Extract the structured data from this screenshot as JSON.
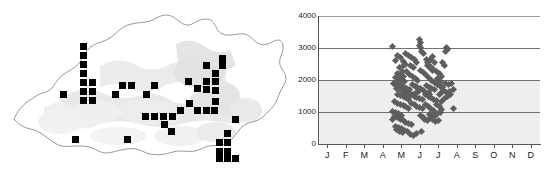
{
  "figure": {
    "panels": [
      "distribution-map",
      "altitude-month-scatter"
    ]
  },
  "map": {
    "region_name": "Bhutan",
    "outline_color": "#8c8c8c",
    "terrain_color": "#e2e2e2",
    "marker_color": "#000000",
    "marker_shape": "square",
    "marker_count": 62,
    "markers": [
      {
        "x": 80,
        "y": 43
      },
      {
        "x": 80,
        "y": 52
      },
      {
        "x": 80,
        "y": 61
      },
      {
        "x": 80,
        "y": 70
      },
      {
        "x": 80,
        "y": 79
      },
      {
        "x": 80,
        "y": 88
      },
      {
        "x": 89,
        "y": 79
      },
      {
        "x": 89,
        "y": 88
      },
      {
        "x": 80,
        "y": 97
      },
      {
        "x": 89,
        "y": 97
      },
      {
        "x": 60,
        "y": 91
      },
      {
        "x": 112,
        "y": 91
      },
      {
        "x": 119,
        "y": 82
      },
      {
        "x": 128,
        "y": 82
      },
      {
        "x": 143,
        "y": 91
      },
      {
        "x": 151,
        "y": 82
      },
      {
        "x": 185,
        "y": 78
      },
      {
        "x": 194,
        "y": 85
      },
      {
        "x": 203,
        "y": 78
      },
      {
        "x": 203,
        "y": 86
      },
      {
        "x": 212,
        "y": 78
      },
      {
        "x": 212,
        "y": 87
      },
      {
        "x": 203,
        "y": 62
      },
      {
        "x": 219,
        "y": 62
      },
      {
        "x": 219,
        "y": 55
      },
      {
        "x": 212,
        "y": 70
      },
      {
        "x": 186,
        "y": 100
      },
      {
        "x": 194,
        "y": 107
      },
      {
        "x": 203,
        "y": 107
      },
      {
        "x": 211,
        "y": 107
      },
      {
        "x": 212,
        "y": 98
      },
      {
        "x": 177,
        "y": 107
      },
      {
        "x": 142,
        "y": 113
      },
      {
        "x": 151,
        "y": 113
      },
      {
        "x": 160,
        "y": 113
      },
      {
        "x": 169,
        "y": 113
      },
      {
        "x": 161,
        "y": 121
      },
      {
        "x": 168,
        "y": 128
      },
      {
        "x": 232,
        "y": 116
      },
      {
        "x": 224,
        "y": 130
      },
      {
        "x": 216,
        "y": 139
      },
      {
        "x": 224,
        "y": 139
      },
      {
        "x": 216,
        "y": 148
      },
      {
        "x": 224,
        "y": 148
      },
      {
        "x": 216,
        "y": 155
      },
      {
        "x": 224,
        "y": 155
      },
      {
        "x": 232,
        "y": 155
      },
      {
        "x": 72,
        "y": 136
      },
      {
        "x": 124,
        "y": 136
      }
    ]
  },
  "chart_data": {
    "type": "scatter",
    "title": "",
    "xlabel": "",
    "ylabel": "",
    "xlim": [
      0,
      12
    ],
    "ylim": [
      0,
      4000
    ],
    "grid": true,
    "legend": false,
    "y_ticks": [
      0,
      1000,
      2000,
      3000,
      4000
    ],
    "y_tick_labels": [
      "0",
      "1000",
      "2000",
      "3000",
      "4000"
    ],
    "x_ticks": [
      1,
      2,
      3,
      4,
      5,
      6,
      7,
      8,
      9,
      10,
      11,
      12
    ],
    "x_tick_labels": [
      "J",
      "F",
      "M",
      "A",
      "M",
      "J",
      "J",
      "A",
      "S",
      "O",
      "N",
      "D"
    ],
    "marker_shape": "diamond",
    "marker_color": "#5e5e5e",
    "point_count": 178,
    "points": [
      {
        "x": 4.05,
        "y": 3060
      },
      {
        "x": 4.3,
        "y": 2760
      },
      {
        "x": 4.45,
        "y": 2700
      },
      {
        "x": 4.2,
        "y": 2620
      },
      {
        "x": 4.6,
        "y": 2580
      },
      {
        "x": 4.75,
        "y": 2820
      },
      {
        "x": 4.9,
        "y": 2760
      },
      {
        "x": 5.05,
        "y": 2690
      },
      {
        "x": 5.2,
        "y": 2640
      },
      {
        "x": 5.35,
        "y": 2560
      },
      {
        "x": 5.5,
        "y": 3260
      },
      {
        "x": 5.55,
        "y": 3180
      },
      {
        "x": 5.5,
        "y": 3090
      },
      {
        "x": 5.52,
        "y": 3010
      },
      {
        "x": 5.6,
        "y": 2900
      },
      {
        "x": 5.7,
        "y": 2820
      },
      {
        "x": 5.85,
        "y": 2640
      },
      {
        "x": 5.9,
        "y": 2560
      },
      {
        "x": 6.1,
        "y": 2640
      },
      {
        "x": 6.2,
        "y": 2740
      },
      {
        "x": 6.3,
        "y": 2560
      },
      {
        "x": 6.95,
        "y": 3020
      },
      {
        "x": 7.0,
        "y": 2940
      },
      {
        "x": 6.9,
        "y": 2900
      },
      {
        "x": 4.4,
        "y": 2380
      },
      {
        "x": 4.55,
        "y": 2280
      },
      {
        "x": 4.3,
        "y": 2200
      },
      {
        "x": 4.45,
        "y": 2140
      },
      {
        "x": 4.6,
        "y": 2100
      },
      {
        "x": 4.2,
        "y": 2080
      },
      {
        "x": 4.35,
        "y": 2020
      },
      {
        "x": 4.5,
        "y": 1980
      },
      {
        "x": 4.65,
        "y": 1940
      },
      {
        "x": 4.8,
        "y": 2260
      },
      {
        "x": 4.95,
        "y": 2180
      },
      {
        "x": 5.1,
        "y": 2100
      },
      {
        "x": 5.25,
        "y": 2040
      },
      {
        "x": 5.4,
        "y": 1980
      },
      {
        "x": 5.55,
        "y": 2300
      },
      {
        "x": 5.7,
        "y": 2220
      },
      {
        "x": 5.85,
        "y": 2140
      },
      {
        "x": 6.0,
        "y": 2060
      },
      {
        "x": 6.15,
        "y": 1980
      },
      {
        "x": 6.3,
        "y": 1920
      },
      {
        "x": 6.45,
        "y": 2040
      },
      {
        "x": 6.6,
        "y": 1960
      },
      {
        "x": 6.1,
        "y": 2420
      },
      {
        "x": 6.25,
        "y": 2340
      },
      {
        "x": 6.4,
        "y": 2280
      },
      {
        "x": 6.55,
        "y": 2200
      },
      {
        "x": 6.7,
        "y": 2120
      },
      {
        "x": 4.1,
        "y": 1880
      },
      {
        "x": 4.25,
        "y": 1820
      },
      {
        "x": 4.4,
        "y": 1780
      },
      {
        "x": 4.55,
        "y": 1740
      },
      {
        "x": 4.7,
        "y": 1700
      },
      {
        "x": 4.85,
        "y": 1660
      },
      {
        "x": 4.2,
        "y": 1900
      },
      {
        "x": 4.35,
        "y": 1860
      },
      {
        "x": 4.5,
        "y": 1820
      },
      {
        "x": 4.65,
        "y": 1780
      },
      {
        "x": 4.8,
        "y": 1740
      },
      {
        "x": 4.95,
        "y": 1700
      },
      {
        "x": 5.1,
        "y": 1860
      },
      {
        "x": 5.25,
        "y": 1800
      },
      {
        "x": 5.4,
        "y": 1760
      },
      {
        "x": 5.55,
        "y": 1720
      },
      {
        "x": 5.7,
        "y": 1680
      },
      {
        "x": 5.85,
        "y": 1820
      },
      {
        "x": 6.0,
        "y": 1780
      },
      {
        "x": 6.15,
        "y": 1740
      },
      {
        "x": 6.3,
        "y": 1700
      },
      {
        "x": 6.45,
        "y": 1860
      },
      {
        "x": 6.6,
        "y": 1800
      },
      {
        "x": 6.75,
        "y": 1760
      },
      {
        "x": 6.9,
        "y": 1900
      },
      {
        "x": 7.05,
        "y": 1860
      },
      {
        "x": 7.2,
        "y": 1880
      },
      {
        "x": 6.8,
        "y": 1660
      },
      {
        "x": 6.95,
        "y": 1620
      },
      {
        "x": 4.3,
        "y": 1560
      },
      {
        "x": 4.45,
        "y": 1520
      },
      {
        "x": 4.6,
        "y": 1480
      },
      {
        "x": 4.75,
        "y": 1440
      },
      {
        "x": 4.9,
        "y": 1400
      },
      {
        "x": 5.05,
        "y": 1560
      },
      {
        "x": 5.2,
        "y": 1500
      },
      {
        "x": 5.35,
        "y": 1460
      },
      {
        "x": 5.5,
        "y": 1420
      },
      {
        "x": 5.65,
        "y": 1380
      },
      {
        "x": 5.8,
        "y": 1540
      },
      {
        "x": 5.95,
        "y": 1480
      },
      {
        "x": 6.1,
        "y": 1440
      },
      {
        "x": 6.25,
        "y": 1400
      },
      {
        "x": 6.4,
        "y": 1360
      },
      {
        "x": 4.15,
        "y": 1320
      },
      {
        "x": 4.3,
        "y": 1280
      },
      {
        "x": 4.45,
        "y": 1240
      },
      {
        "x": 4.6,
        "y": 1200
      },
      {
        "x": 4.75,
        "y": 1160
      },
      {
        "x": 4.9,
        "y": 1120
      },
      {
        "x": 5.05,
        "y": 1260
      },
      {
        "x": 5.2,
        "y": 1220
      },
      {
        "x": 5.35,
        "y": 1180
      },
      {
        "x": 5.5,
        "y": 1140
      },
      {
        "x": 5.65,
        "y": 1100
      },
      {
        "x": 5.8,
        "y": 1240
      },
      {
        "x": 5.95,
        "y": 1180
      },
      {
        "x": 6.1,
        "y": 1120
      },
      {
        "x": 6.25,
        "y": 1060
      },
      {
        "x": 6.4,
        "y": 1220
      },
      {
        "x": 6.55,
        "y": 1160
      },
      {
        "x": 6.7,
        "y": 1080
      },
      {
        "x": 7.3,
        "y": 1100
      },
      {
        "x": 4.05,
        "y": 1020
      },
      {
        "x": 4.2,
        "y": 980
      },
      {
        "x": 4.35,
        "y": 940
      },
      {
        "x": 4.5,
        "y": 900
      },
      {
        "x": 4.15,
        "y": 860
      },
      {
        "x": 4.3,
        "y": 820
      },
      {
        "x": 4.0,
        "y": 780
      },
      {
        "x": 4.45,
        "y": 760
      },
      {
        "x": 4.6,
        "y": 720
      },
      {
        "x": 4.75,
        "y": 680
      },
      {
        "x": 4.9,
        "y": 640
      },
      {
        "x": 5.05,
        "y": 600
      },
      {
        "x": 4.2,
        "y": 560
      },
      {
        "x": 4.35,
        "y": 520
      },
      {
        "x": 4.5,
        "y": 480
      },
      {
        "x": 4.25,
        "y": 440
      },
      {
        "x": 4.4,
        "y": 400
      },
      {
        "x": 4.55,
        "y": 360
      },
      {
        "x": 4.7,
        "y": 420
      },
      {
        "x": 4.85,
        "y": 380
      },
      {
        "x": 5.0,
        "y": 300
      },
      {
        "x": 5.15,
        "y": 260
      },
      {
        "x": 5.3,
        "y": 340
      },
      {
        "x": 5.6,
        "y": 400
      },
      {
        "x": 5.75,
        "y": 760
      },
      {
        "x": 5.9,
        "y": 720
      },
      {
        "x": 6.05,
        "y": 800
      },
      {
        "x": 6.2,
        "y": 760
      },
      {
        "x": 6.35,
        "y": 700
      },
      {
        "x": 6.5,
        "y": 740
      },
      {
        "x": 6.05,
        "y": 920
      },
      {
        "x": 6.2,
        "y": 880
      },
      {
        "x": 5.55,
        "y": 880
      },
      {
        "x": 5.7,
        "y": 840
      },
      {
        "x": 6.6,
        "y": 1000
      },
      {
        "x": 6.45,
        "y": 960
      },
      {
        "x": 6.35,
        "y": 900
      },
      {
        "x": 6.7,
        "y": 1340
      },
      {
        "x": 6.85,
        "y": 1420
      },
      {
        "x": 7.0,
        "y": 1480
      },
      {
        "x": 7.15,
        "y": 1560
      },
      {
        "x": 7.3,
        "y": 1700
      },
      {
        "x": 6.55,
        "y": 1560
      },
      {
        "x": 6.7,
        "y": 1620
      },
      {
        "x": 5.95,
        "y": 1620
      },
      {
        "x": 6.05,
        "y": 1560
      },
      {
        "x": 5.45,
        "y": 1640
      },
      {
        "x": 5.3,
        "y": 1600
      },
      {
        "x": 5.15,
        "y": 1560
      },
      {
        "x": 5.0,
        "y": 1520
      },
      {
        "x": 4.85,
        "y": 1580
      },
      {
        "x": 4.7,
        "y": 1620
      },
      {
        "x": 4.55,
        "y": 1660
      },
      {
        "x": 4.4,
        "y": 1700
      },
      {
        "x": 4.25,
        "y": 1740
      },
      {
        "x": 4.6,
        "y": 2440
      },
      {
        "x": 4.75,
        "y": 2480
      },
      {
        "x": 5.9,
        "y": 2460
      },
      {
        "x": 6.05,
        "y": 2380
      },
      {
        "x": 6.2,
        "y": 2300
      },
      {
        "x": 5.15,
        "y": 2380
      },
      {
        "x": 5.0,
        "y": 2440
      },
      {
        "x": 6.75,
        "y": 2560
      },
      {
        "x": 6.85,
        "y": 2460
      },
      {
        "x": 7.1,
        "y": 1640
      }
    ]
  }
}
